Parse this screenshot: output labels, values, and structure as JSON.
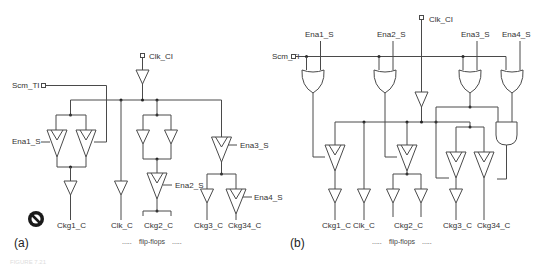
{
  "figure": {
    "caption_faint": "FIGURE 7.21",
    "panel_a": {
      "label": "(a)",
      "inputs": {
        "clock": "Clk_CI",
        "scan": "Scm_TI"
      },
      "enables": [
        "Ena1_S",
        "Ena2_S",
        "Ena3_S",
        "Ena4_S"
      ],
      "outputs": [
        "Ckg1_C",
        "Clk_C",
        "Ckg2_C",
        "Ckg3_C",
        "Ckg34_C"
      ],
      "footer": "flip-flops",
      "footer_dots": "....."
    },
    "panel_b": {
      "label": "(b)",
      "inputs": {
        "clock": "Clk_CI",
        "scan": "Scm_TI"
      },
      "enables": [
        "Ena1_S",
        "Ena2_S",
        "Ena3_S",
        "Ena4_S"
      ],
      "outputs": [
        "Ckg1_C",
        "Clk_C",
        "Ckg2_C",
        "Ckg3_C",
        "Ckg34_C"
      ],
      "footer": "flip-flops",
      "footer_dots": "....."
    },
    "icons": {
      "prohibited": "no-entry-icon"
    },
    "colors": {
      "wire": "#4a4a4a",
      "text": "#333333",
      "background": "#ffffff"
    }
  }
}
